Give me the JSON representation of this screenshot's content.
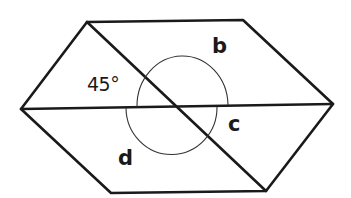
{
  "diagram": {
    "type": "geometry-angles",
    "labels": {
      "angle_given": "45°",
      "b": "b",
      "c": "c",
      "d": "d"
    },
    "vertices": {
      "top_left": [
        87,
        22
      ],
      "top_right": [
        243,
        20
      ],
      "right": [
        333,
        104
      ],
      "bottom_right": [
        266,
        191
      ],
      "bottom_left": [
        111,
        193
      ],
      "left": [
        21,
        109
      ]
    },
    "intersection": [
      178,
      107
    ],
    "colors": {
      "line": "#1a1a1a",
      "arc": "#333333",
      "background": "#ffffff"
    }
  }
}
